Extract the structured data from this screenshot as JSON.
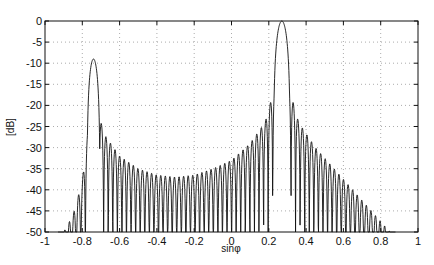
{
  "chart_data": {
    "type": "line",
    "title": "",
    "xlabel": "sinφ",
    "ylabel": "[dB]",
    "xlim": [
      -1,
      1
    ],
    "ylim": [
      -50,
      0
    ],
    "grid": true,
    "legend": null,
    "x_ticks": [
      -1,
      -0.8,
      -0.6,
      -0.4,
      -0.2,
      0,
      0.2,
      0.4,
      0.6,
      0.8,
      1
    ],
    "x_tick_labels": [
      "-1",
      "-0.8",
      "-0.6",
      "-0.4",
      "-0.2",
      "0",
      "0.2",
      "0.4",
      "0.6",
      "0.8",
      "1"
    ],
    "y_ticks": [
      0,
      -5,
      -10,
      -15,
      -20,
      -25,
      -30,
      -35,
      -40,
      -45,
      -50
    ],
    "y_tick_labels": [
      "0",
      "-5",
      "-10",
      "-15",
      "-20",
      "-25",
      "-30",
      "-35",
      "-40",
      "-45",
      "-50"
    ],
    "series": [
      {
        "name": "beam pattern",
        "color": "#111111",
        "main_lobe": {
          "x": 0.27,
          "y": 0
        },
        "secondary_lobe": {
          "x": -0.74,
          "y": -9
        },
        "sidelobe_envelope": {
          "x": [
            -0.9,
            -0.85,
            -0.8,
            -0.76,
            -0.72,
            -0.68,
            -0.6,
            -0.5,
            -0.4,
            -0.3,
            -0.2,
            -0.1,
            0.0,
            0.1,
            0.18,
            0.23,
            0.31,
            0.36,
            0.45,
            0.55,
            0.65,
            0.75,
            0.85
          ],
          "y": [
            -50,
            -46,
            -38,
            -22,
            -21,
            -27,
            -32,
            -35,
            -36.5,
            -37,
            -36.5,
            -35,
            -33,
            -29,
            -24,
            -16,
            -16,
            -24,
            -30,
            -35,
            -40,
            -45,
            -50
          ]
        },
        "nulls_depth_db": -50
      }
    ]
  }
}
